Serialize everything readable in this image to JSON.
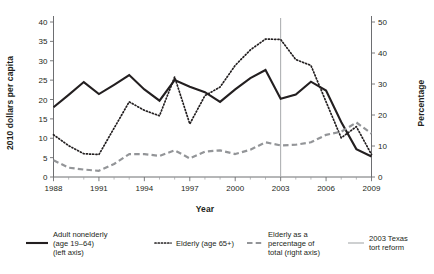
{
  "chart_data": {
    "type": "line",
    "title": "",
    "xlabel": "Year",
    "ylabel_left": "2010 dollars per capita",
    "ylabel_right": "Percentage",
    "xlim": [
      1988,
      2009
    ],
    "ylim_left": [
      0,
      40
    ],
    "ylim_right": [
      0,
      50
    ],
    "grid": false,
    "legend_position": "below",
    "x": [
      1988,
      1989,
      1990,
      1991,
      1992,
      1993,
      1994,
      1995,
      1996,
      1997,
      1998,
      1999,
      2000,
      2001,
      2002,
      2003,
      2004,
      2005,
      2006,
      2007,
      2008,
      2009
    ],
    "xticks": [
      1988,
      1991,
      1994,
      1997,
      2000,
      2003,
      2006,
      2009
    ],
    "xtick_labels": [
      "1988",
      "1991",
      "1994",
      "1997",
      "2000",
      "2003",
      "2006",
      "2009"
    ],
    "yticks_left": [
      0,
      5,
      10,
      15,
      20,
      25,
      30,
      35,
      40
    ],
    "ytick_labels_left": [
      "0",
      "5",
      "10",
      "15",
      "20",
      "25",
      "30",
      "35",
      "40"
    ],
    "yticks_right": [
      0,
      10,
      20,
      30,
      40,
      50
    ],
    "ytick_labels_right": [
      "0",
      "10",
      "20",
      "30",
      "40",
      "50"
    ],
    "annotations": [
      {
        "type": "vline",
        "x": 2003,
        "label": "2003 Texas tort reform"
      }
    ],
    "series": [
      {
        "name": "Adult nonelderly (age 19–64) (left axis)",
        "axis": "left",
        "style": "solid",
        "color": "#231f20",
        "values": [
          18.0,
          21.2,
          24.5,
          21.4,
          23.8,
          26.3,
          22.6,
          19.7,
          25.0,
          23.3,
          21.9,
          19.4,
          22.6,
          25.5,
          27.6,
          20.2,
          21.3,
          24.6,
          22.3,
          14.2,
          7.2,
          5.3
        ]
      },
      {
        "name": "Elderly (age 65+)",
        "axis": "left",
        "style": "dotted",
        "color": "#231f20",
        "values": [
          10.9,
          8.1,
          6.0,
          5.8,
          12.6,
          19.4,
          17.2,
          15.8,
          25.8,
          13.7,
          21.0,
          23.2,
          28.8,
          32.8,
          35.6,
          35.5,
          30.3,
          28.8,
          19.4,
          10.1,
          13.0,
          5.8
        ]
      },
      {
        "name": "Elderly as a percentage of total (right axis)",
        "axis": "right",
        "style": "dashed",
        "color": "#939598",
        "values": [
          5.4,
          3.0,
          2.4,
          2.0,
          4.2,
          7.4,
          7.4,
          6.8,
          8.6,
          6.0,
          8.2,
          8.6,
          7.4,
          8.8,
          11.2,
          10.2,
          10.4,
          11.2,
          13.6,
          14.6,
          17.6,
          14.0
        ]
      }
    ]
  },
  "legend": {
    "items": [
      {
        "label_lines": [
          "Adult nonelderly",
          "(age 19–64)",
          "(left axis)"
        ],
        "style": "solid"
      },
      {
        "label_lines": [
          "Elderly (age 65+)"
        ],
        "style": "dotted"
      },
      {
        "label_lines": [
          "Elderly as a",
          "percentage of",
          "total (right axis)"
        ],
        "style": "dashed"
      },
      {
        "label_lines": [
          "2003 Texas",
          "tort reform"
        ],
        "style": "vline"
      }
    ]
  },
  "colors": {
    "solid": "#231f20",
    "dotted": "#231f20",
    "dashed": "#939598",
    "vline": "#a7a9ac",
    "axis": "#6d6e71",
    "background": "#ffffff"
  }
}
